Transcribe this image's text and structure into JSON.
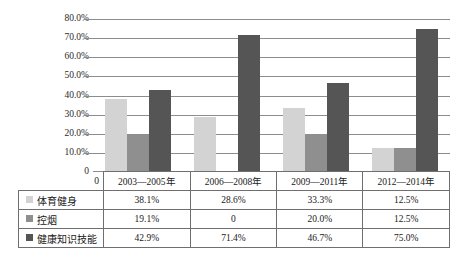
{
  "chart_data": {
    "type": "bar",
    "title": "",
    "subtitle": "",
    "xlabel": "",
    "ylabel": "",
    "categories": [
      "2003—2005年",
      "2006—2008年",
      "2009—2011年",
      "2012—2014年"
    ],
    "series": [
      {
        "name": "体育健身",
        "color": "#d3d3d3",
        "values": [
          38.1,
          28.6,
          33.3,
          12.5
        ],
        "labels": [
          "38.1%",
          "28.6%",
          "33.3%",
          "12.5%"
        ]
      },
      {
        "name": "控烟",
        "color": "#8f8f8f",
        "values": [
          19.1,
          0,
          20.0,
          12.5
        ],
        "labels": [
          "19.1%",
          "0",
          "20.0%",
          "12.5%"
        ]
      },
      {
        "name": "健康知识技能",
        "color": "#555555",
        "values": [
          42.9,
          71.4,
          46.7,
          75.0
        ],
        "labels": [
          "42.9%",
          "71.4%",
          "46.7%",
          "75.0%"
        ]
      }
    ],
    "ylim": [
      0,
      80
    ],
    "ytick_values": [
      0,
      10,
      20,
      30,
      40,
      50,
      60,
      70,
      80
    ],
    "ytick_labels": [
      "0",
      "10.0%",
      "20.0%",
      "30.0%",
      "40.0%",
      "50.0%",
      "60.0%",
      "70.0%",
      "80.0%"
    ],
    "grid": true,
    "legend_position": "table-first-column",
    "gridline_color": "#8d8d8d",
    "axis_origin_label": "0"
  },
  "table": {
    "corner_label": "0",
    "column_headers": [
      "2003—2005年",
      "2006—2008年",
      "2009—2011年",
      "2012—2014年"
    ],
    "rows": [
      {
        "label": "体育健身",
        "swatch_color": "#d3d3d3",
        "cells": [
          "38.1%",
          "28.6%",
          "33.3%",
          "12.5%"
        ]
      },
      {
        "label": "控烟",
        "swatch_color": "#8f8f8f",
        "cells": [
          "19.1%",
          "0",
          "20.0%",
          "12.5%"
        ]
      },
      {
        "label": "健康知识技能",
        "swatch_color": "#555555",
        "cells": [
          "42.9%",
          "71.4%",
          "46.7%",
          "75.0%"
        ]
      }
    ]
  }
}
